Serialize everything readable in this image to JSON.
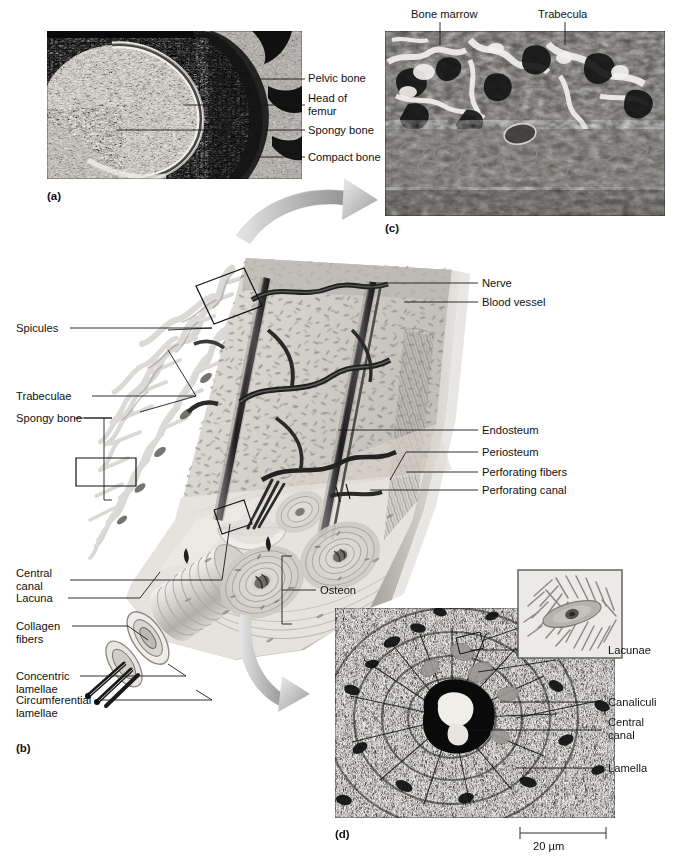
{
  "figure": {
    "panels": [
      {
        "key": "(a)",
        "name": "proximal-femur-section-photograph"
      },
      {
        "key": "(b)",
        "name": "compact-and-spongy-bone-illustration"
      },
      {
        "key": "(c)",
        "name": "spongy-bone-micrograph"
      },
      {
        "key": "(d)",
        "name": "osteon-cross-section-micrograph"
      }
    ]
  },
  "panel_a": {
    "key": "(a)",
    "labels": [
      {
        "text": "Pelvic bone"
      },
      {
        "text": "Head of\nfemur"
      },
      {
        "text": "Spongy bone"
      },
      {
        "text": "Compact bone"
      }
    ]
  },
  "panel_b": {
    "key": "(b)",
    "left_labels": [
      {
        "text": "Spicules"
      },
      {
        "text": "Trabeculae"
      },
      {
        "text": "Spongy bone"
      },
      {
        "text": "Central\ncanal"
      },
      {
        "text": "Lacuna"
      },
      {
        "text": "Collagen\nfibers"
      },
      {
        "text": "Concentric\nlamellae"
      },
      {
        "text": "Circumferential\nlamellae"
      }
    ],
    "right_labels": [
      {
        "text": "Nerve"
      },
      {
        "text": "Blood vessel"
      },
      {
        "text": "Endosteum"
      },
      {
        "text": "Periosteum"
      },
      {
        "text": "Perforating fibers"
      },
      {
        "text": "Perforating canal"
      },
      {
        "text": "Osteon"
      }
    ]
  },
  "panel_c": {
    "key": "(c)",
    "labels": [
      {
        "text": "Bone marrow"
      },
      {
        "text": "Trabecula"
      }
    ]
  },
  "panel_d": {
    "key": "(d)",
    "labels": [
      {
        "text": "Lacunae"
      },
      {
        "text": "Canaliculi"
      },
      {
        "text": "Central\ncanal"
      },
      {
        "text": "Lamella"
      }
    ],
    "scale_bar": {
      "text": "20 µm"
    },
    "inset": {
      "name": "osteocyte-in-lacuna-inset"
    }
  },
  "colors": {
    "ink": "#111111",
    "leader_line": "#1a1a1a",
    "bone_light": "#e8e6e2",
    "bone_mid": "#c9c6c0",
    "bone_dark": "#8d8a85",
    "vessel_dark": "#2b2b2b",
    "arrow_gray": "#a9a9a9",
    "panel_border": "#5a5a5a"
  }
}
